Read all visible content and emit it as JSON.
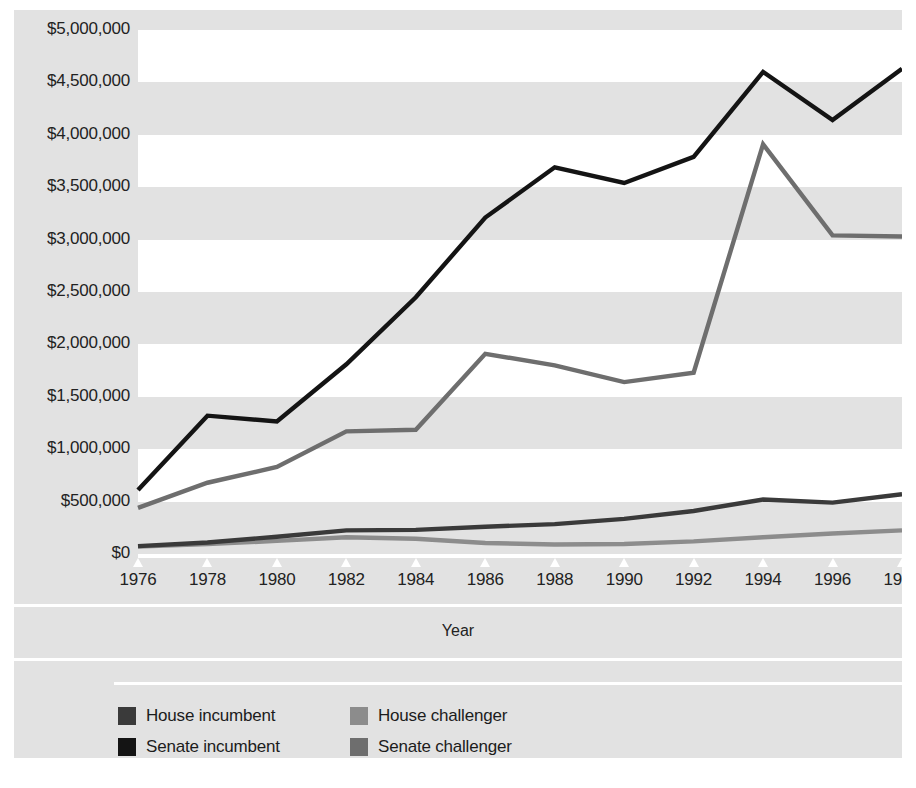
{
  "chart_data": {
    "type": "line",
    "title": "",
    "subtitle": "",
    "xlabel": "Year",
    "ylabel": "",
    "categories": [
      1976,
      1978,
      1980,
      1982,
      1984,
      1986,
      1988,
      1990,
      1992,
      1994,
      1996,
      1998
    ],
    "x_tick_labels": [
      "1976",
      "1978",
      "1980",
      "1982",
      "1984",
      "1986",
      "1988",
      "1990",
      "1992",
      "1994",
      "1996",
      "1998"
    ],
    "y_tick_labels": [
      "$0",
      "$500,000",
      "$1,000,000",
      "$1,500,000",
      "$2,000,000",
      "$2,500,000",
      "$3,000,000",
      "$3,500,000",
      "$4,000,000",
      "$4,500,000",
      "$5,000,000"
    ],
    "y_tick_values": [
      0,
      500000,
      1000000,
      1500000,
      2000000,
      2500000,
      3000000,
      3500000,
      4000000,
      4500000,
      5000000
    ],
    "ylim": [
      0,
      5000000
    ],
    "xlim": [
      1976,
      1998
    ],
    "grid": "alternating-horizontal-bands",
    "legend_position": "bottom-left",
    "series": [
      {
        "name": "House incumbent",
        "color": "#3a3a3a",
        "values": [
          75000,
          110000,
          165000,
          225000,
          230000,
          260000,
          285000,
          335000,
          410000,
          520000,
          490000,
          570000
        ]
      },
      {
        "name": "Senate incumbent",
        "color": "#141414",
        "values": [
          610000,
          1320000,
          1265000,
          1810000,
          2450000,
          3210000,
          3690000,
          3540000,
          3790000,
          4600000,
          4140000,
          4630000
        ]
      },
      {
        "name": "House challenger",
        "color": "#8c8c8c",
        "values": [
          70000,
          95000,
          125000,
          160000,
          145000,
          105000,
          90000,
          95000,
          120000,
          160000,
          195000,
          225000
        ]
      },
      {
        "name": "Senate challenger",
        "color": "#6e6e6e",
        "values": [
          440000,
          680000,
          830000,
          1170000,
          1185000,
          1910000,
          1800000,
          1640000,
          1730000,
          3910000,
          3040000,
          3030000
        ]
      }
    ]
  },
  "axis": {
    "x_title": "Year"
  },
  "legend": {
    "items": [
      {
        "label": "House incumbent",
        "color": "#3a3a3a"
      },
      {
        "label": "House challenger",
        "color": "#8c8c8c"
      },
      {
        "label": "Senate incumbent",
        "color": "#141414"
      },
      {
        "label": "Senate challenger",
        "color": "#6e6e6e"
      }
    ]
  },
  "colors": {
    "figure_background": "#e2e2e2",
    "band_light": "#ffffff",
    "band_gray": "#e2e2e2",
    "text": "#222222"
  }
}
